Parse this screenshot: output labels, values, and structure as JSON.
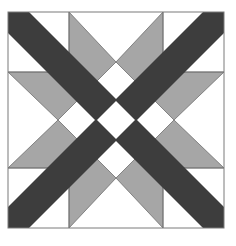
{
  "diagram": {
    "colors": {
      "background": "#ffffff",
      "dark": "#3d3d3d",
      "medium": "#a6a6a6",
      "light": "#ffffff",
      "outline": "#7a7a7a"
    },
    "block": {
      "x": 8,
      "y": 12,
      "size": 216
    },
    "grid_lines": {
      "vertical": [
        69,
        163
      ],
      "horizontal": [
        72,
        168
      ]
    },
    "pieces": {
      "dark_bands": 2,
      "medium_kites": 8,
      "light_center_squares": 5
    }
  }
}
